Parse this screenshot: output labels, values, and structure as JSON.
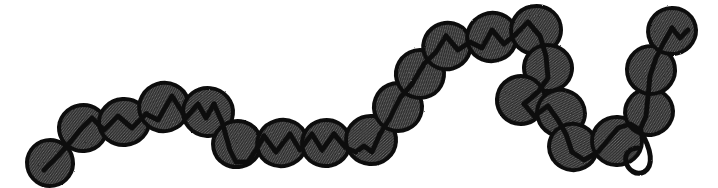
{
  "figure": {
    "width": 718,
    "height": 188,
    "background_color": "#ffffff",
    "bead_fill_color": "#3b3b3b",
    "bead_outline_color": "#111111",
    "strand_color": "#111111",
    "bead_count": 26
  },
  "beads": [
    {
      "id": "bead-01",
      "cx": 50,
      "cy": 163,
      "rx": 23,
      "ry": 23,
      "rot": -10,
      "notch": "hook"
    },
    {
      "id": "bead-02",
      "cx": 83,
      "cy": 128,
      "rx": 24,
      "ry": 23,
      "rot": -8,
      "notch": "zigzag"
    },
    {
      "id": "bead-03",
      "cx": 124,
      "cy": 122,
      "rx": 25,
      "ry": 23,
      "rot": -4,
      "notch": "zigzag"
    },
    {
      "id": "bead-04",
      "cx": 164,
      "cy": 107,
      "rx": 25,
      "ry": 24,
      "rot": -18,
      "notch": "slash"
    },
    {
      "id": "bead-05",
      "cx": 208,
      "cy": 112,
      "rx": 25,
      "ry": 24,
      "rot": 6,
      "notch": "hook"
    },
    {
      "id": "bead-06",
      "cx": 237,
      "cy": 144,
      "rx": 24,
      "ry": 23,
      "rot": -12,
      "notch": "slash"
    },
    {
      "id": "bead-07",
      "cx": 282,
      "cy": 143,
      "rx": 25,
      "ry": 23,
      "rot": -16,
      "notch": "slash"
    },
    {
      "id": "bead-08",
      "cx": 326,
      "cy": 143,
      "rx": 24,
      "ry": 23,
      "rot": -14,
      "notch": "slash"
    },
    {
      "id": "bead-09",
      "cx": 371,
      "cy": 140,
      "rx": 25,
      "ry": 24,
      "rot": 4,
      "notch": "vee"
    },
    {
      "id": "bead-10",
      "cx": 398,
      "cy": 107,
      "rx": 24,
      "ry": 24,
      "rot": -24,
      "notch": "slash"
    },
    {
      "id": "bead-11",
      "cx": 420,
      "cy": 74,
      "rx": 24,
      "ry": 24,
      "rot": -26,
      "notch": "slash"
    },
    {
      "id": "bead-12",
      "cx": 447,
      "cy": 46,
      "rx": 24,
      "ry": 23,
      "rot": -30,
      "notch": "vee"
    },
    {
      "id": "bead-13",
      "cx": 492,
      "cy": 37,
      "rx": 25,
      "ry": 24,
      "rot": -22,
      "notch": "slash"
    },
    {
      "id": "bead-14",
      "cx": 536,
      "cy": 30,
      "rx": 25,
      "ry": 24,
      "rot": -12,
      "notch": "hook"
    },
    {
      "id": "bead-15",
      "cx": 548,
      "cy": 68,
      "rx": 24,
      "ry": 23,
      "rot": 8,
      "notch": "hook"
    },
    {
      "id": "bead-16",
      "cx": 521,
      "cy": 100,
      "rx": 24,
      "ry": 24,
      "rot": 14,
      "notch": "slash"
    },
    {
      "id": "bead-17",
      "cx": 561,
      "cy": 113,
      "rx": 24,
      "ry": 23,
      "rot": 18,
      "notch": "slash"
    },
    {
      "id": "bead-18",
      "cx": 573,
      "cy": 147,
      "rx": 24,
      "ry": 23,
      "rot": 16,
      "notch": "slash"
    },
    {
      "id": "bead-19",
      "cx": 617,
      "cy": 141,
      "rx": 25,
      "ry": 24,
      "rot": 2,
      "notch": "vee"
    },
    {
      "id": "bead-20",
      "cx": 649,
      "cy": 112,
      "rx": 24,
      "ry": 23,
      "rot": -14,
      "notch": "line"
    },
    {
      "id": "bead-21",
      "cx": 651,
      "cy": 70,
      "rx": 24,
      "ry": 24,
      "rot": -10,
      "notch": "line"
    },
    {
      "id": "bead-22",
      "cx": 672,
      "cy": 31,
      "rx": 24,
      "ry": 23,
      "rot": -14,
      "notch": "vee"
    }
  ],
  "strand": {
    "name": "chain-strand",
    "segments": [
      "M 44 170 L 58 156 L 72 140 L 80 130",
      "M 80 130 L 92 118 L 104 130 L 118 116 L 132 128 L 146 114",
      "M 146 114 L 158 120 L 172 96 L 186 118 L 198 104 L 206 118 L 214 104",
      "M 214 104 L 222 122 L 230 150 L 236 162 L 248 162 L 256 150 L 264 136",
      "M 264 136 L 276 152 L 290 134 L 300 150 L 312 134 L 322 150 L 334 134",
      "M 334 134 L 346 148 L 356 152 L 364 146 L 372 152 L 380 134",
      "M 380 134 L 390 118 L 400 98 L 412 84 L 424 64 L 436 52 L 446 36",
      "M 446 36 L 458 50 L 470 42 L 482 48 L 492 30 L 504 44 L 516 34",
      "M 516 34 L 528 22 L 540 36 L 546 56 L 548 78 L 538 92 L 524 104",
      "M 524 104 L 534 116 L 548 106 L 558 120 L 566 134 L 572 152",
      "M 572 152 L 584 160 L 598 152 L 608 140 L 618 128 L 630 124 L 640 130",
      "M 640 130 L 646 116 L 648 96 L 650 76 L 656 58 L 664 42 L 672 28",
      "M 672 28 L 680 38 L 688 30"
    ],
    "tail_loop": "M 640 130 C 652 150 654 166 644 172 C 636 176 628 170 626 162 C 624 154 630 148 638 148"
  },
  "labels": {
    "caption": ""
  }
}
